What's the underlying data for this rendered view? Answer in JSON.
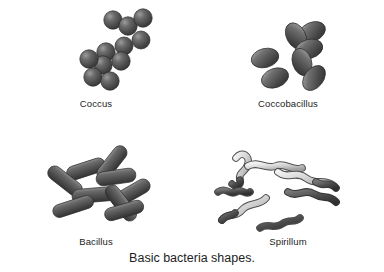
{
  "figure": {
    "caption": "Basic bacteria shapes.",
    "background_color": "#ffffff",
    "text_color": "#1d1d1d",
    "panels": [
      {
        "id": "coccus",
        "label": "Coccus",
        "shape_type": "spheres",
        "cell_count": 11,
        "fill_color": "#4a4a4a",
        "highlight_color": "#8e8e8e",
        "outline_color": "#2b2b2b"
      },
      {
        "id": "coccobacillus",
        "label": "Coccobacillus",
        "shape_type": "ovals",
        "cell_count": 7,
        "fill_color": "#4a4a4a",
        "highlight_color": "#9a9a9a",
        "outline_color": "#2b2b2b"
      },
      {
        "id": "bacillus",
        "label": "Bacillus",
        "shape_type": "rods",
        "cell_count": 9,
        "fill_color": "#555555",
        "highlight_color": "#a0a0a0",
        "outline_color": "#2f2f2f"
      },
      {
        "id": "spirillum",
        "label": "Spirillum",
        "shape_type": "spirals",
        "cell_count": 7,
        "fill_color": "#d2d2d2",
        "highlight_color": "#f0f0f0",
        "outline_color": "#4f4f4f",
        "tip_color": "#4a4a4a"
      }
    ]
  }
}
